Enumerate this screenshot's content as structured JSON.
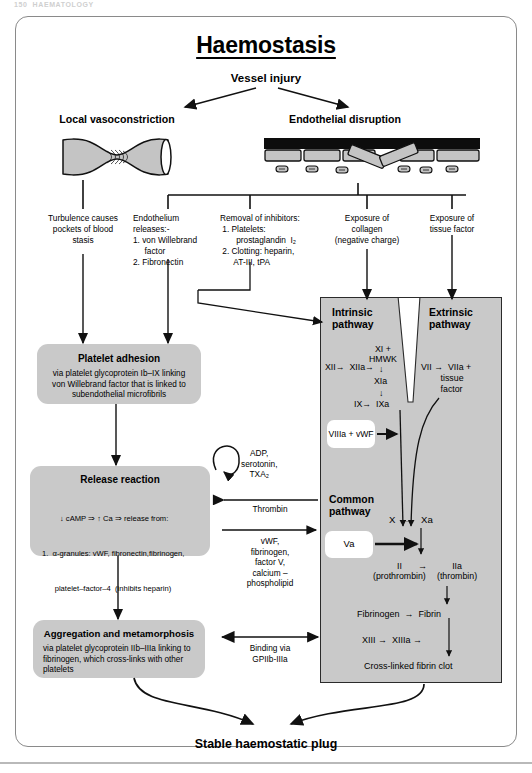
{
  "page": {
    "running_head": "150  HAEMATOLOGY",
    "title": "Haemostasis",
    "root_node": "Vessel injury",
    "outcome": "Stable haemostatic plug"
  },
  "branches": {
    "left_label": "Local vasoconstriction",
    "right_label": "Endothelial disruption"
  },
  "columns": [
    {
      "name": "turbulence",
      "text": "Turbulence causes\npockets of blood\nstasis"
    },
    {
      "name": "endothelium",
      "text": "Endothelium\nreleases:-\n1. von Willebrand\n     factor\n2. Fibronectin"
    },
    {
      "name": "removal-inhibitors",
      "text": "Removal of inhibitors:\n 1. Platelets:\n       prostaglandin  I₂\n 2. Clotting: heparin,\n      AT-III, tPA"
    },
    {
      "name": "exposure-collagen",
      "text": "Exposure of\ncollagen\n(negative charge)"
    },
    {
      "name": "exposure-tissue-factor",
      "text": "Exposure of\ntissue factor"
    }
  ],
  "platelet_boxes": [
    {
      "name": "platelet-adhesion",
      "heading": "Platelet adhesion",
      "body": "via platelet glycoprotein Ib–IX linking\nvon Willebrand factor that is linked to\nsubendothelial microfibrils"
    },
    {
      "name": "release-reaction",
      "heading": "Release reaction",
      "body_lines": [
        "↓ cAMP ⇒ ↑ Ca ⇒ release from:",
        "1.  α-granules: vWF, fibronectin,fibrinogen,",
        "      platelet–factor–4  (inhibits heparin)",
        "2.  δ-granules (dense):  ADP, serotonin, Ca",
        "3. Tubular system:        thromboxane A₂"
      ]
    },
    {
      "name": "aggregation-metamorphosis",
      "heading": "Aggregation and metamorphosis",
      "body": "via platelet glycoprotein IIb–IIIa linking to\nfibrinogen, which cross-links with other\nplatelets"
    }
  ],
  "middle_labels": [
    {
      "name": "autocrine-loop",
      "text": "ADP,\nserotonin,\nTXA₂"
    },
    {
      "name": "thrombin-arrow",
      "text": "Thrombin"
    },
    {
      "name": "coag-factors",
      "text": "vWF,\nfibrinogen,\nfactor V,\ncalcium –\nphospholipid"
    },
    {
      "name": "binding-gpiibiiia",
      "text": "Binding via\nGPIIb-IIIa"
    }
  ],
  "cascade": {
    "intrinsic_title": "Intrinsic\npathway",
    "extrinsic_title": "Extrinsic\npathway",
    "common_title": "Common\npathway",
    "nodes": [
      {
        "name": "xii-xiia",
        "text": "XII→  XIIa→"
      },
      {
        "name": "xi-hmwk",
        "text": "XI +\nHMWK"
      },
      {
        "name": "arrow-down-1",
        "text": "↓"
      },
      {
        "name": "xia",
        "text": "XIa"
      },
      {
        "name": "arrow-down-2",
        "text": "↓"
      },
      {
        "name": "ix-ixa",
        "text": "IX→  IXa"
      },
      {
        "name": "vii-viia",
        "text": "VII →  VIIa +\n        tissue\n        factor"
      },
      {
        "name": "x-xa",
        "text": "X   →   Xa"
      },
      {
        "name": "ii-prothrombin",
        "text": "II\n(prothrombin)"
      },
      {
        "name": "iia-thrombin",
        "text": "IIa\n(thrombin)"
      },
      {
        "name": "arrow-ii-iia",
        "text": "→"
      },
      {
        "name": "fibrinogen-fibrin",
        "text": "Fibrinogen  →  Fibrin"
      },
      {
        "name": "xiii-xiiia",
        "text": "XIII →  XIIIa →"
      },
      {
        "name": "crosslinked-clot",
        "text": "Cross-linked fibrin clot"
      }
    ],
    "white_boxes": [
      {
        "name": "viiia-vwf",
        "text": "VIIIa +\n  vWF"
      },
      {
        "name": "va",
        "text": "Va"
      }
    ]
  },
  "colors": {
    "box_gray": "#c9c9c9",
    "panel_border": "#2b2b2b",
    "card_border": "#8a8a8a",
    "ink": "#000000",
    "rule": "#b9b9b9"
  }
}
